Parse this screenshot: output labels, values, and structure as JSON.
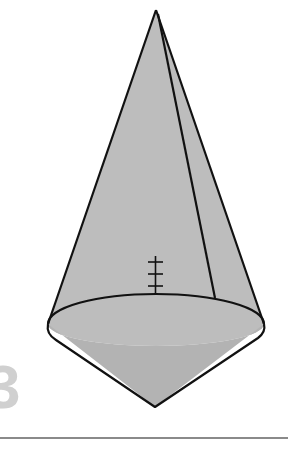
{
  "figure": {
    "type": "composite solid: cone on top of cone (spinning top)",
    "caption_fragment": "3",
    "colors": {
      "surface_fill": "#bdbdbd",
      "base_fill": "#b3b3b3",
      "stroke": "#111111",
      "rule": "#8a8a8a",
      "faded_label": "#d0d0d0"
    },
    "marks": {
      "tick_count": 3,
      "description": "height marker with 3 crossbars on cone axis"
    }
  }
}
